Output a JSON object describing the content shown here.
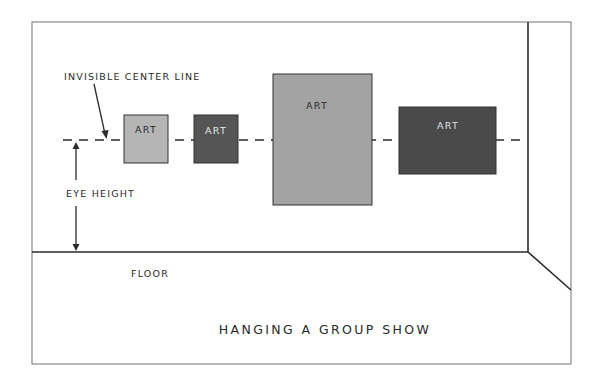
{
  "diagram": {
    "title": "HANGING A GROUP SHOW",
    "labels": {
      "center_line": "INVISIBLE CENTER LINE",
      "eye_height": "EYE HEIGHT",
      "floor": "FLOOR"
    },
    "artworks": [
      {
        "label": "ART",
        "fill": "#b5b5b5",
        "text_color": "#2a2a2a"
      },
      {
        "label": "ART",
        "fill": "#555555",
        "text_color": "#e8e8e8"
      },
      {
        "label": "ART",
        "fill": "#a3a3a3",
        "text_color": "#2a2a2a"
      },
      {
        "label": "ART",
        "fill": "#4a4a4a",
        "text_color": "#e0e0e0"
      }
    ],
    "colors": {
      "frame": "#8a8a8a",
      "wall_lines": "#2b2b2b",
      "text": "#2a2a2a"
    }
  }
}
